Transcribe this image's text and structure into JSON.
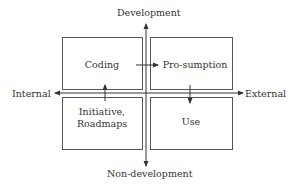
{
  "diagram": {
    "axes": {
      "top": "Development",
      "bottom": "Non-development",
      "left": "Internal",
      "right": "External"
    },
    "quadrants": {
      "top_left": "Coding",
      "top_right": "Pro-sumption",
      "bottom_left_line1": "Initiative,",
      "bottom_left_line2": "Roadmaps",
      "bottom_right": "Use"
    },
    "arrows": [
      {
        "from": "Coding",
        "to": "Pro-sumption"
      },
      {
        "from": "Pro-sumption",
        "to": "Use"
      },
      {
        "from": "Initiative, Roadmaps",
        "to": "Coding"
      }
    ],
    "colors": {
      "line": "#333333",
      "box": "#555555"
    }
  }
}
